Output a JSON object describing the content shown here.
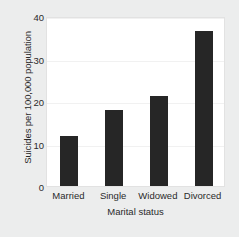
{
  "chart_data": {
    "type": "bar",
    "title": "",
    "categories": [
      "Married",
      "Single",
      "Widowed",
      "Divorced"
    ],
    "values": [
      12,
      18,
      21.5,
      37
    ],
    "xlabel": "Marital status",
    "ylabel": "Suicides per 100,000 population",
    "ylim": [
      0,
      40
    ],
    "yticks": [
      0,
      10,
      20,
      30,
      40
    ],
    "ytick_labels": [
      "0",
      "10",
      "20",
      "30",
      "40"
    ],
    "grid": true,
    "legend": null,
    "bar_color": "#262626",
    "plot_background": "#ffffff",
    "figure_background": "#eceded"
  }
}
